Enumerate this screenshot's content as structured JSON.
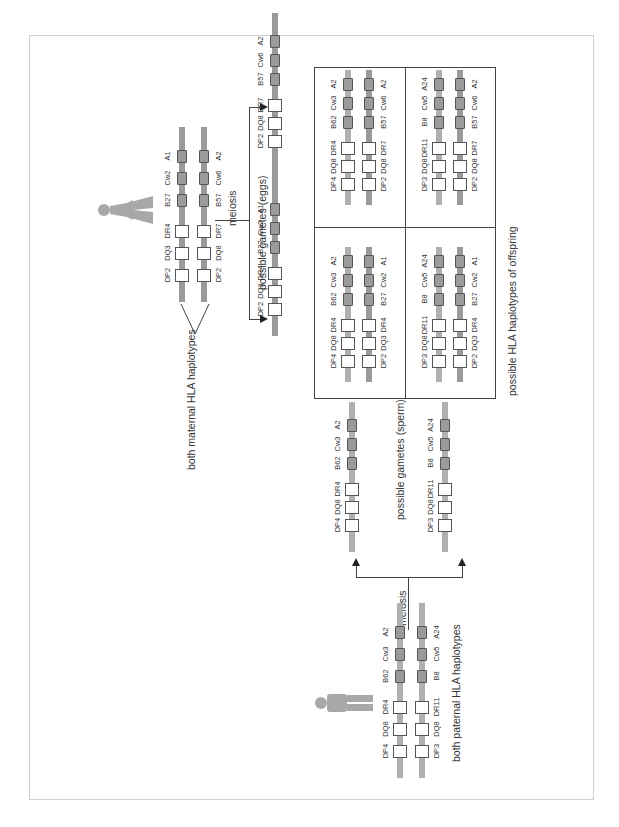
{
  "diagram": {
    "orientation": "rotated-90-ccw",
    "labels": {
      "maternal": "both maternal HLA haplotypes",
      "paternal": "both paternal HLA haplotypes",
      "eggs": "possible gametes (eggs)",
      "sperm": "possible gametes (sperm)",
      "offspring": "possible HLA haplotypes of offspring",
      "meiosis_mother": "meiosis",
      "meiosis_father": "meiosis"
    },
    "icons": {
      "mother": "female-figure-icon",
      "father": "male-figure-icon"
    },
    "loci": [
      "DP",
      "DQ",
      "DR",
      "B",
      "Cw",
      "A"
    ],
    "haplotypes": {
      "maternal_1": [
        "DP2",
        "DQ3",
        "DR4",
        "B27",
        "Cw2",
        "A1"
      ],
      "maternal_2": [
        "DP2",
        "DQ8",
        "DR7",
        "B57",
        "Cw6",
        "A2"
      ],
      "paternal_1": [
        "DP4",
        "DQ8",
        "DR4",
        "B62",
        "Cw3",
        "A2"
      ],
      "paternal_2": [
        "DP3",
        "DQ8",
        "DR11",
        "B8",
        "Cw5",
        "A24"
      ]
    },
    "offspring_grid": [
      {
        "cell": "top-left",
        "sperm": [
          "DP4",
          "DQ8",
          "DR4",
          "B62",
          "Cw3",
          "A2"
        ],
        "egg": [
          "DP2",
          "DQ3",
          "DR4",
          "B27",
          "Cw2",
          "A1"
        ]
      },
      {
        "cell": "top-right",
        "sperm": [
          "DP4",
          "DQ8",
          "DR4",
          "B62",
          "Cw3",
          "A2"
        ],
        "egg": [
          "DP2",
          "DQ8",
          "DR7",
          "B57",
          "Cw6",
          "A2"
        ]
      },
      {
        "cell": "bottom-left",
        "sperm": [
          "DP3",
          "DQ8",
          "DR11",
          "B8",
          "Cw5",
          "A24"
        ],
        "egg": [
          "DP2",
          "DQ3",
          "DR4",
          "B27",
          "Cw2",
          "A1"
        ]
      },
      {
        "cell": "bottom-right",
        "sperm": [
          "DP3",
          "DQ8",
          "DR11",
          "B8",
          "Cw5",
          "A24"
        ],
        "egg": [
          "DP2",
          "DQ8",
          "DR7",
          "B57",
          "Cw6",
          "A2"
        ]
      }
    ],
    "colors": {
      "chromosome_light": "#b0b0b0",
      "chromosome_dark": "#9a9a9a",
      "class1_box": "#9b9b9b",
      "class2_box": "#ffffff",
      "figure": "#a8a8a8",
      "frame": "#cfcfcf",
      "lines": "#444444"
    }
  }
}
